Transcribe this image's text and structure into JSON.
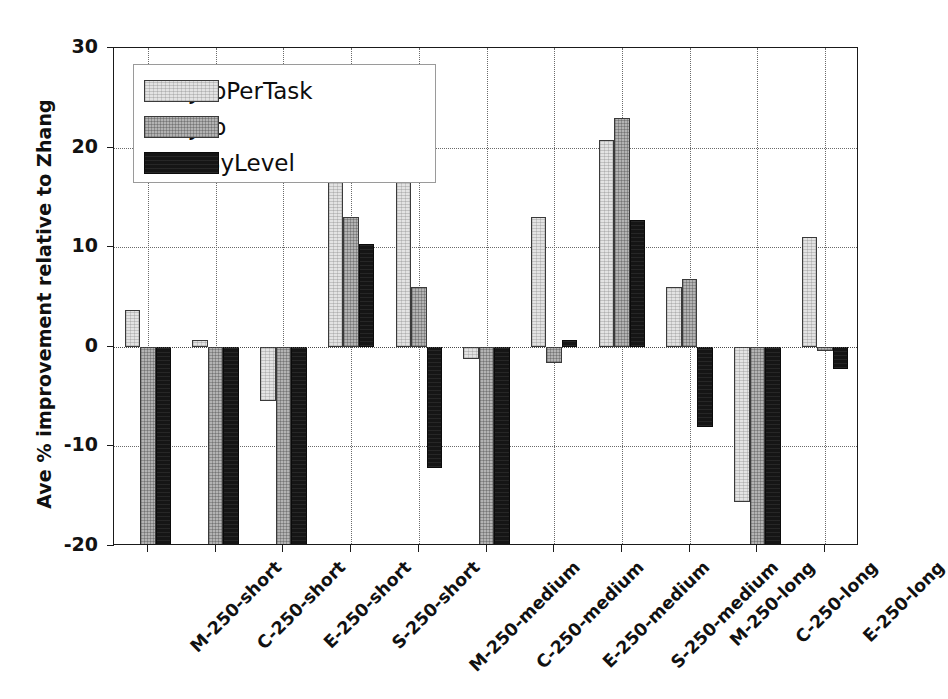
{
  "chart_data": {
    "type": "bar",
    "title": "",
    "xlabel": "",
    "ylabel": "Ave % improvement relative to Zhang",
    "ylim": [
      -20,
      30
    ],
    "yticks": [
      30,
      20,
      10,
      0,
      -10,
      -20
    ],
    "ytick_labels": [
      "30",
      "20",
      "10",
      "0",
      "-10",
      "-20"
    ],
    "grid": true,
    "legend_position": "upper left",
    "categories": [
      "M-250-short",
      "C-250-short",
      "E-250-short",
      "S-250-short",
      "M-250-medium",
      "C-250-medium",
      "E-250-medium",
      "S-250-medium",
      "M-250-long",
      "C-250-long",
      "E-250-long"
    ],
    "series": [
      {
        "name": "OneJobPerTask",
        "color": "#e3e3e3",
        "values": [
          3.7,
          0.7,
          -5.4,
          20.0,
          17.0,
          -1.2,
          13.0,
          20.8,
          6.0,
          -15.6,
          11.0
        ]
      },
      {
        "name": "OneJob",
        "color": "#b3b3b3",
        "values": [
          -24.0,
          -24.0,
          -24.0,
          13.0,
          6.0,
          -24.0,
          -1.6,
          23.0,
          6.8,
          -24.0,
          -0.4
        ]
      },
      {
        "name": "LevelByLevel",
        "color": "#151515",
        "values": [
          -24.0,
          -24.0,
          -24.0,
          10.3,
          -12.2,
          -24.0,
          0.7,
          12.7,
          -8.1,
          -24.0,
          -2.2
        ]
      }
    ]
  },
  "legend": {
    "items": [
      {
        "label": "OneJobPerTask",
        "swatch": "light-gray-hatched"
      },
      {
        "label": "OneJob",
        "swatch": "medium-gray-hatched"
      },
      {
        "label": "LevelByLevel",
        "swatch": "black"
      }
    ]
  }
}
